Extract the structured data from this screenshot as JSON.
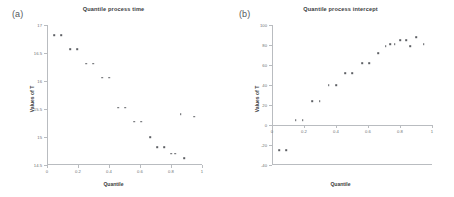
{
  "figure": {
    "background": "#ffffff",
    "point_color": "#5d6064",
    "axis_color": "#b9bcc0"
  },
  "panels": [
    {
      "tag": "(a)",
      "title": "Quantile process time",
      "xlabel": "Quantile",
      "ylabel": "Values of T"
    },
    {
      "tag": "(b)",
      "title": "Quantile process intercept",
      "xlabel": "Quantile",
      "ylabel": "Values of T"
    }
  ],
  "chart_data": [
    {
      "type": "scatter",
      "title": "Quantile process time",
      "panel": "(a)",
      "xlabel": "Quantile",
      "ylabel": "Values of T",
      "xlim": [
        0,
        1
      ],
      "ylim": [
        14.5,
        17.0
      ],
      "xticks": [
        0,
        0.2,
        0.4,
        0.6,
        0.8,
        1
      ],
      "xticklabels": [
        "0",
        "0.2",
        "0.4",
        "0.6",
        "0.8",
        "1"
      ],
      "yticks": [
        14.5,
        15.0,
        15.5,
        16.0,
        16.5,
        17.0
      ],
      "yticklabels": [
        "14.5",
        "15",
        "15.5",
        "16",
        "16.5",
        "17",
        "17.0"
      ],
      "grid": false,
      "legend": false,
      "points": [
        {
          "x": 0.045,
          "y": 16.82
        },
        {
          "x": 0.09,
          "y": 16.82
        },
        {
          "x": 0.148,
          "y": 16.57
        },
        {
          "x": 0.193,
          "y": 16.57
        },
        {
          "x": 0.252,
          "y": 16.31
        },
        {
          "x": 0.297,
          "y": 16.31
        },
        {
          "x": 0.355,
          "y": 16.06
        },
        {
          "x": 0.4,
          "y": 16.06
        },
        {
          "x": 0.458,
          "y": 15.52
        },
        {
          "x": 0.503,
          "y": 15.52
        },
        {
          "x": 0.562,
          "y": 15.27
        },
        {
          "x": 0.607,
          "y": 15.27
        },
        {
          "x": 0.665,
          "y": 15.0
        },
        {
          "x": 0.71,
          "y": 14.82
        },
        {
          "x": 0.755,
          "y": 14.82
        },
        {
          "x": 0.8,
          "y": 14.7
        },
        {
          "x": 0.828,
          "y": 14.7
        },
        {
          "x": 0.862,
          "y": 15.41
        },
        {
          "x": 0.885,
          "y": 14.62
        },
        {
          "x": 0.948,
          "y": 15.36
        }
      ]
    },
    {
      "type": "scatter",
      "title": "Quantile process intercept",
      "panel": "(b)",
      "xlabel": "Quantile",
      "ylabel": "Values of T",
      "xlim": [
        0,
        1
      ],
      "ylim": [
        -40,
        100
      ],
      "xticks": [
        0,
        0.2,
        0.4,
        0.6,
        0.8,
        1
      ],
      "xticklabels": [
        "0",
        "0.2",
        "0.4",
        "0.6",
        "0.8",
        "1"
      ],
      "yticks": [
        -40,
        -20,
        0,
        20,
        40,
        60,
        80,
        100
      ],
      "yticklabels": [
        "-40",
        "-20",
        "0",
        "20",
        "40",
        "60",
        "80",
        "100"
      ],
      "grid": false,
      "legend": false,
      "points": [
        {
          "x": 0.045,
          "y": -25
        },
        {
          "x": 0.09,
          "y": -25
        },
        {
          "x": 0.148,
          "y": 5
        },
        {
          "x": 0.193,
          "y": 5
        },
        {
          "x": 0.252,
          "y": 24
        },
        {
          "x": 0.297,
          "y": 24
        },
        {
          "x": 0.355,
          "y": 40
        },
        {
          "x": 0.4,
          "y": 40
        },
        {
          "x": 0.458,
          "y": 52
        },
        {
          "x": 0.503,
          "y": 52
        },
        {
          "x": 0.562,
          "y": 62
        },
        {
          "x": 0.607,
          "y": 62
        },
        {
          "x": 0.665,
          "y": 72
        },
        {
          "x": 0.71,
          "y": 79
        },
        {
          "x": 0.74,
          "y": 81
        },
        {
          "x": 0.768,
          "y": 81
        },
        {
          "x": 0.8,
          "y": 85
        },
        {
          "x": 0.838,
          "y": 85
        },
        {
          "x": 0.862,
          "y": 79
        },
        {
          "x": 0.9,
          "y": 88
        },
        {
          "x": 0.948,
          "y": 81
        }
      ]
    }
  ]
}
